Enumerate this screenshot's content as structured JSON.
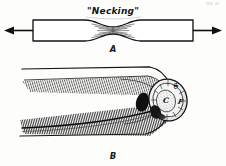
{
  "figure": {
    "background_color": "#fdfdfc",
    "ink_color": "#141414",
    "corner_mark": "Fig",
    "panels": [
      {
        "id": "A",
        "letter": "A",
        "caption_label": "\"Necking\"",
        "description": "Tensile test specimen bar showing necking at mid-length with tension arrows at both ends"
      },
      {
        "id": "B",
        "letter": "B",
        "description": "Cup-and-cone ductile fracture surface of broken specimen, shaded with fine hatching"
      }
    ],
    "zone_labels": [
      {
        "key": "S",
        "text": "S"
      },
      {
        "key": "C",
        "text": "C"
      },
      {
        "key": "F",
        "text": "F"
      }
    ]
  }
}
